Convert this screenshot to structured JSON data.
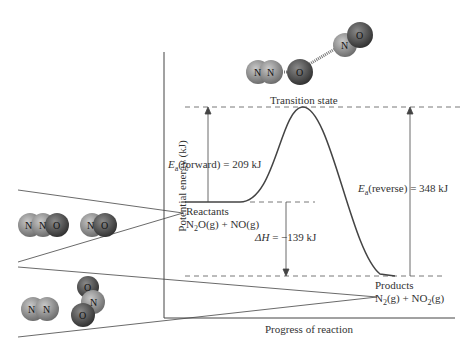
{
  "diagram": {
    "y_axis_label": "Potential energy (kJ)",
    "x_axis_label": "Progress of reaction",
    "transition_state_label": "Transition state",
    "reactants": {
      "label": "Reactants",
      "formula_main": "N",
      "formula_sub": "2",
      "formula_rest": "O(g) + NO(g)"
    },
    "products": {
      "label": "Products",
      "formula_a": "N",
      "formula_a_sub": "2",
      "formula_b": "(g) + NO",
      "formula_b_sub": "2",
      "formula_c": "(g)"
    },
    "ea_forward": {
      "E": "E",
      "sub": "a",
      "text": "(forward) = 209 kJ"
    },
    "ea_reverse": {
      "E": "E",
      "sub": "a",
      "text": "(reverse) = 348 kJ"
    },
    "delta_h": {
      "symbol": "ΔH",
      "text": " = −139 kJ"
    },
    "molecules": {
      "ts": [
        "N",
        "N",
        "O",
        "N",
        "O"
      ],
      "reactant_n2o": [
        "N",
        "N",
        "O"
      ],
      "reactant_no": [
        "N",
        "O"
      ],
      "product_n2": [
        "N",
        "N"
      ],
      "product_no2": [
        "O",
        "N",
        "O"
      ]
    },
    "energies_kJ": {
      "ea_forward": 209,
      "ea_reverse": 348,
      "delta_h": -139
    }
  },
  "colors": {
    "nitrogen": "#8a8a8a",
    "oxygen": "#4a4a4a",
    "line": "#444444"
  }
}
